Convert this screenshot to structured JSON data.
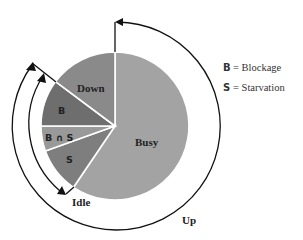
{
  "diagram": {
    "slices": [
      {
        "id": "busy",
        "label": "Busy",
        "color": "#a3a3a3"
      },
      {
        "id": "starvation",
        "label": "S",
        "color": "#7e7e7e"
      },
      {
        "id": "blockage-and-starvation",
        "label": "B ∩ S",
        "color": "#999999"
      },
      {
        "id": "blockage",
        "label": "B",
        "color": "#6e6e6e"
      },
      {
        "id": "down",
        "label": "Down",
        "color": "#8a8a8a"
      }
    ],
    "arcs": {
      "up_label": "Up",
      "idle_label": "Idle"
    },
    "legend": [
      {
        "symbol": "B",
        "text": "= Blockage"
      },
      {
        "symbol": "S",
        "text": "= Starvation"
      }
    ]
  }
}
